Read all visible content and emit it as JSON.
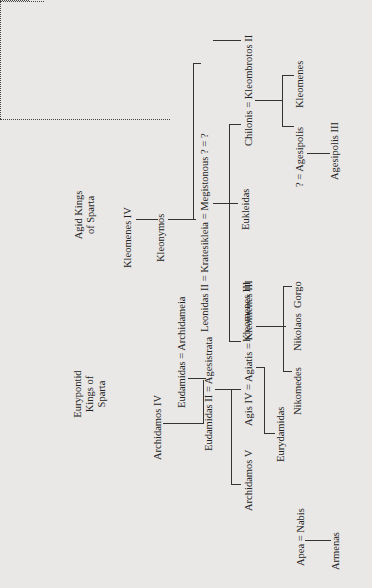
{
  "diagram": {
    "type": "family-tree",
    "orientation": "rotated-90-ccw",
    "headers": {
      "agid": "Agid Kings of Sparta",
      "agid_line1": "Agid Kings",
      "agid_line2": "of Sparta",
      "eurypontid_line1": "Eurypontid",
      "eurypontid_line2": "Kings of",
      "eurypontid_line3": "Sparta"
    },
    "agid_line": {
      "kleomenes_iv": "Kleomenes IV",
      "kleonymos": "Kleonymos",
      "marriage_row": "Leonidas II = Kratesikleia = Megistonous   ? = ?",
      "eukleidas": "Eukleidas",
      "kleomenes_iii": "Kleomenes III",
      "chilonis_row": "Chilonis = Kleombrotos II",
      "agesipolis_row": "? = Agesipolis",
      "kleomenes": "Kleomenes",
      "agesipolis_iii": "Agesipolis III"
    },
    "eurypontid_line": {
      "archidamos_iv": "Archidamos IV",
      "eudamidas_archidameia": "Eudamidas = Archidameia",
      "eudamidas_ii_row": "Eudamidas II = Agesistrata",
      "agis_row": "Agis IV = Agiatis = Kleomenes III",
      "archidamos_v": "Archidamos V",
      "eurydamidas": "Eurydamidas",
      "nikomedes": "Nikomedes",
      "nikolaos": "Nikolaos",
      "gorgo": "Gorgo",
      "apea_nabis": "Apea = Nabis",
      "armenas": "Armenas"
    }
  }
}
